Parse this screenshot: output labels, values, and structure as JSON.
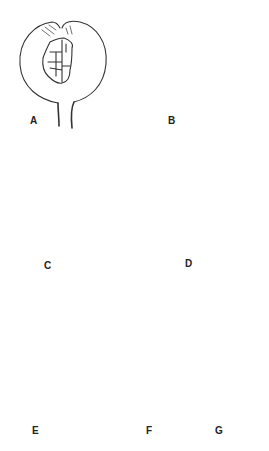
{
  "figure": {
    "panels": [
      {
        "id": "A",
        "label": "A",
        "description": "Spherical head with central cluster of cells, short stalk"
      },
      {
        "id": "B",
        "label": "B",
        "description": "Pear-shaped head with fan of segments on left side"
      },
      {
        "id": "C",
        "label": "C",
        "description": "Rounded head with curved band of many stacked segments"
      },
      {
        "id": "D",
        "label": "D",
        "description": "Elongated head with diagonal chain of segments, long stalk"
      },
      {
        "id": "E",
        "label": "E",
        "description": "Elongated head with upper dark segments and lower pale segments"
      },
      {
        "id": "F",
        "label": "F",
        "description": "Round head with upper segment fan, tear, and lower small segment group"
      },
      {
        "id": "G",
        "label": "G",
        "description": "Elongate head with column of large rounded segments, long stalk"
      }
    ]
  }
}
